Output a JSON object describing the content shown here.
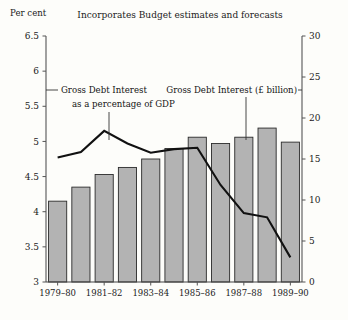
{
  "chart_data": {
    "type": "bar",
    "title": "Incorporates Budget estimates and forecasts",
    "xlabel": "",
    "ylabel": "Per cent",
    "y2label": "£ billion",
    "grid": false,
    "legend": "annotations",
    "categories": [
      "1979–80",
      "1980–81",
      "1981–82",
      "1982–83",
      "1983–84",
      "1984–85",
      "1985–86",
      "1986–87",
      "1987–88",
      "1988–89",
      "1989–90"
    ],
    "x_tick_labels": [
      "1979–80",
      "",
      "1981–82",
      "",
      "1983–84",
      "",
      "1985–86",
      "",
      "1987–88",
      "",
      "1989–90"
    ],
    "ylim": [
      3,
      6.5
    ],
    "y_ticks": [
      "3",
      "3.5",
      "4",
      "4.5",
      "5",
      "5.5",
      "6",
      "6.5"
    ],
    "y2lim": [
      0,
      30
    ],
    "y2_ticks": [
      "0",
      "5",
      "10",
      "15",
      "20",
      "25",
      "30"
    ],
    "series": [
      {
        "name": "Gross Debt Interest (£ billion)",
        "type": "bar",
        "axis": "right",
        "values": [
          9.9,
          11.4,
          13.1,
          13.9,
          15.3,
          16.4,
          17.5,
          16.9,
          17.5,
          18.8,
          17.1
        ],
        "bar_values_left_axis": [
          4.15,
          4.35,
          4.53,
          4.63,
          4.75,
          4.9,
          5.06,
          4.97,
          5.06,
          5.19,
          4.99
        ]
      },
      {
        "name": "Gross Debt Interest as a percentage of GDP",
        "type": "line",
        "axis": "left",
        "values": [
          4.77,
          4.85,
          5.15,
          4.97,
          4.84,
          4.89,
          4.91,
          4.38,
          3.98,
          3.92,
          3.35
        ]
      }
    ],
    "annotations": [
      {
        "text_line1": "Gross Debt Interest",
        "text_line2": "as a percentage of GDP",
        "target_category": "1981–82"
      },
      {
        "text_line1": "Gross Debt Interest (£ billion)",
        "text_line2": "",
        "target_category": "1986–87"
      }
    ]
  },
  "labels": {
    "left_axis_caption": "Per cent",
    "title": "Incorporates Budget estimates and forecasts",
    "annotation_gdp_l1": "Gross Debt Interest",
    "annotation_gdp_l2": "as a percentage of GDP",
    "annotation_billion": "Gross Debt Interest (£ billion)"
  },
  "colors": {
    "background": "#fdfdfa",
    "bar_fill": "#b3b3b3",
    "bar_stroke": "#2b2b2b",
    "line": "#111111",
    "axis": "#555555",
    "text": "#1a1a1a"
  }
}
